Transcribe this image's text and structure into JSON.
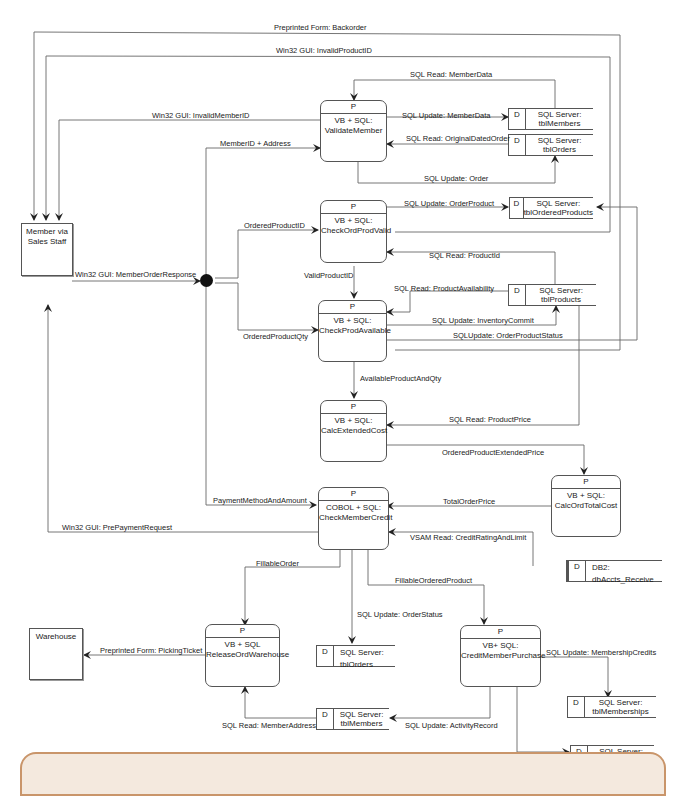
{
  "diagram": {
    "type": "data-flow-diagram",
    "colors": {
      "line": "#555555",
      "footer_border": "#c9956a",
      "footer_fill": "#f4e9de"
    },
    "externals": [
      {
        "id": "member",
        "label": "Member via\nSales Staff"
      },
      {
        "id": "warehouse",
        "label": "Warehouse"
      }
    ],
    "processes": [
      {
        "id": "validate",
        "pid": "P",
        "label": "VB + SQL:\nValidateMember"
      },
      {
        "id": "checkord",
        "pid": "P",
        "label": "VB + SQL:\nCheckOrdProdValid"
      },
      {
        "id": "checkprod",
        "pid": "P",
        "label": "VB + SQL:\nCheckProdAvailable"
      },
      {
        "id": "calcext",
        "pid": "P",
        "label": "VB + SQL:\nCalcExtendedCost"
      },
      {
        "id": "calctotal",
        "pid": "P",
        "label": "VB + SQL:\nCalcOrdTotalCost"
      },
      {
        "id": "checkcredit",
        "pid": "P",
        "label": "COBOL + SQL:\nCheckMemberCredit"
      },
      {
        "id": "release",
        "pid": "P",
        "label": "VB + SQL\nReleaseOrdWarehouse"
      },
      {
        "id": "creditpurchase",
        "pid": "P",
        "label": "VB+ SQL:\nCreditMemberPurchase"
      }
    ],
    "stores": [
      {
        "id": "members1",
        "sid": "D",
        "label": "SQL Server:\ntblMembers"
      },
      {
        "id": "orders1",
        "sid": "D",
        "label": "SQL Server:\ntblOrders"
      },
      {
        "id": "orderedproducts",
        "sid": "D",
        "label": "SQL Server:\ntblOrderedProducts"
      },
      {
        "id": "products",
        "sid": "D",
        "label": "SQL Server:\ntblProducts"
      },
      {
        "id": "acctsreceive",
        "sid": "D",
        "label": "DB2: dbAccts_Receive"
      },
      {
        "id": "orders2",
        "sid": "D",
        "label": "SQL Server: tblOrders"
      },
      {
        "id": "members2",
        "sid": "D",
        "label": "SQL Server:\ntblMembers"
      },
      {
        "id": "memberships",
        "sid": "D",
        "label": "SQL Server:\ntblMemberships"
      },
      {
        "id": "agreements",
        "sid": "D",
        "label": "SQL Server:\ntblAgreements"
      }
    ],
    "flows": [
      {
        "id": "backorder",
        "label": "Preprinted Form: Backorder"
      },
      {
        "id": "invalidproduct",
        "label": "Win32 GUI: InvalidProductID"
      },
      {
        "id": "invalidmember",
        "label": "Win32 GUI: InvalidMemberID"
      },
      {
        "id": "memberaddress",
        "label": "MemberID + Address"
      },
      {
        "id": "readmemberdata",
        "label": "SQL Read: MemberData"
      },
      {
        "id": "updatememberdata",
        "label": "SQL Update: MemberData"
      },
      {
        "id": "readoriginal",
        "label": "SQL Read: OriginalDatedOrder"
      },
      {
        "id": "updateorder",
        "label": "SQL Update: Order"
      },
      {
        "id": "updateorderproduct",
        "label": "SQL Update: OrderProduct"
      },
      {
        "id": "orderedproductid",
        "label": "OrderedProductID"
      },
      {
        "id": "memberorderresponse",
        "label": "Win32 GUI: MemberOrderResponse"
      },
      {
        "id": "readproductid",
        "label": "SQL Read: ProductId"
      },
      {
        "id": "validproductid",
        "label": "ValidProductID"
      },
      {
        "id": "readavailability",
        "label": "SQL Read: ProductAvailability"
      },
      {
        "id": "inventorycommit",
        "label": "SQL Update: InventoryCommit"
      },
      {
        "id": "orderedproductqty",
        "label": "OrderedProductQty"
      },
      {
        "id": "orderproductstatus",
        "label": "SQLUpdate: OrderProductStatus"
      },
      {
        "id": "availableproductandqty",
        "label": "AvailableProductAndQty"
      },
      {
        "id": "readproductprice",
        "label": "SQL Read: ProductPrice"
      },
      {
        "id": "extendedprice",
        "label": "OrderedProductExtendedPrice"
      },
      {
        "id": "paymentmethod",
        "label": "PaymentMethodAndAmount"
      },
      {
        "id": "totalorderprice",
        "label": "TotalOrderPrice"
      },
      {
        "id": "prepayment",
        "label": "Win32 GUI: PrePaymentRequest"
      },
      {
        "id": "creditrating",
        "label": "VSAM Read: CreditRatingAndLimit"
      },
      {
        "id": "fillableorder",
        "label": "FillableOrder"
      },
      {
        "id": "fillableorderedproduct",
        "label": "FillableOrderedProduct"
      },
      {
        "id": "orderstatus",
        "label": "SQL Update: OrderStatus"
      },
      {
        "id": "pickingticket",
        "label": "Preprinted Form: PickingTicket"
      },
      {
        "id": "membershipcredits",
        "label": "SQL Update: MembershipCredits"
      },
      {
        "id": "readmemberaddress",
        "label": "SQL Read: MemberAddress"
      },
      {
        "id": "activityrecord",
        "label": "SQL Update: ActivityRecord"
      },
      {
        "id": "agreementstats",
        "label": "SQL Update: AgreementStats"
      }
    ]
  }
}
